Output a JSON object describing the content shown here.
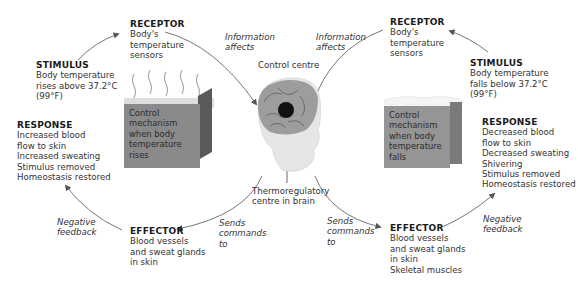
{
  "diagram": {
    "center": {
      "label": "Control centre",
      "sublabel_lines": [
        "Thermoregulatory",
        "centre in brain"
      ]
    },
    "left_loop": {
      "receptor": {
        "title": "RECEPTOR",
        "lines": [
          "Body's",
          "temperature",
          "sensors"
        ]
      },
      "stimulus": {
        "title": "STIMULUS",
        "lines": [
          "Body temperature",
          "rises above 37.2°C",
          "(99°F)"
        ]
      },
      "control_box": {
        "lines": [
          "Control",
          "mechanism",
          "when body",
          "temperature",
          "rises"
        ]
      },
      "response": {
        "title": "RESPONSE",
        "lines": [
          "Increased blood",
          "flow to skin",
          "Increased sweating",
          "Stimulus removed",
          "Homeostasis restored"
        ]
      },
      "effector": {
        "title": "EFFECTOR",
        "lines": [
          "Blood vessels",
          "and sweat glands",
          "in skin"
        ]
      },
      "info_label": [
        "Information",
        "affects"
      ],
      "commands_label": [
        "Sends",
        "commands",
        "to"
      ],
      "feedback_label": [
        "Negative",
        "feedback"
      ]
    },
    "right_loop": {
      "receptor": {
        "title": "RECEPTOR",
        "lines": [
          "Body's",
          "temperature",
          "sensors"
        ]
      },
      "stimulus": {
        "title": "STIMULUS",
        "lines": [
          "Body temperature",
          "falls below 37.2°C",
          "(99°F)"
        ]
      },
      "control_box": {
        "lines": [
          "Control",
          "mechanism",
          "when body",
          "temperature",
          "falls"
        ]
      },
      "response": {
        "title": "RESPONSE",
        "lines": [
          "Decreased blood",
          "flow to skin",
          "Decreased sweating",
          "Shivering",
          "Stimulus removed",
          "Homeostasis restored"
        ]
      },
      "effector": {
        "title": "EFFECTOR",
        "lines": [
          "Blood vessels",
          "and sweat glands",
          "in skin",
          "Skeletal muscles"
        ]
      },
      "info_label": [
        "Information",
        "affects"
      ],
      "commands_label": [
        "Sends",
        "commands",
        "to"
      ],
      "feedback_label": [
        "Negative",
        "feedback"
      ]
    },
    "colors": {
      "box_front": "#8a8a8a",
      "box_side": "#5a5a5a",
      "box_top": "#c9c9c9",
      "arrow": "#555555",
      "brain_spot": "#111111"
    }
  }
}
